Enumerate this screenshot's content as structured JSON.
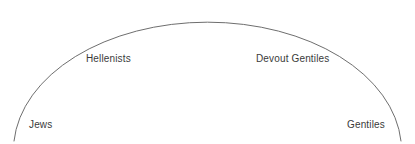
{
  "diagram": {
    "type": "arc-spectrum",
    "background_color": "#ffffff",
    "arc": {
      "name": "spectrum-arc",
      "stroke_color": "#6e6e6e",
      "stroke_width": 1,
      "left_endpoint": [
        14,
        141
      ],
      "right_endpoint": [
        401,
        141
      ],
      "apex": [
        207,
        13
      ]
    },
    "labels": [
      {
        "id": "jews",
        "text": "Jews",
        "position": "bottom-left",
        "color": "#3a3a3a"
      },
      {
        "id": "hellenists",
        "text": "Hellenists",
        "position": "upper-left",
        "color": "#3a3a3a"
      },
      {
        "id": "devout_gentiles",
        "text": "Devout Gentiles",
        "position": "upper-right",
        "color": "#3a3a3a"
      },
      {
        "id": "gentiles",
        "text": "Gentiles",
        "position": "bottom-right",
        "color": "#3a3a3a"
      }
    ]
  }
}
